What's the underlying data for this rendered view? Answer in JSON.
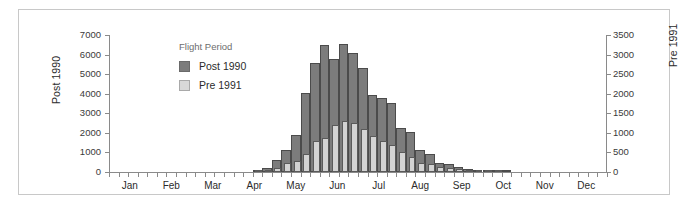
{
  "frame": {
    "border_color": "#c8c8c8"
  },
  "legend": {
    "title": "Flight Period",
    "entries": [
      {
        "label": "Post 1990",
        "color": "#7c7c7c",
        "icon": "legend-swatch-icon"
      },
      {
        "label": "Pre 1991",
        "color": "#d8d8d8",
        "icon": "legend-swatch-icon"
      }
    ]
  },
  "chart_data": {
    "type": "bar",
    "title": "",
    "subtitle": "",
    "xlabel": "",
    "legend_title": "Flight Period",
    "legend_position": "inside-upper-left",
    "grid": false,
    "bar_mode": "overlap",
    "xaxis": {
      "tick_labels": [
        "Jan",
        "Feb",
        "Mar",
        "Apr",
        "May",
        "Jun",
        "Jul",
        "Aug",
        "Sep",
        "Oct",
        "Nov",
        "Dec"
      ],
      "minor_ticks_per_label": 4,
      "bins": "weekly",
      "n_bins": 52
    },
    "yaxis_left": {
      "label": "Post 1990",
      "ylim": [
        0,
        7000
      ],
      "ticks": [
        0,
        1000,
        2000,
        3000,
        4000,
        5000,
        6000,
        7000
      ],
      "tick_labels": [
        "0",
        "1000",
        "2000",
        "3000",
        "4000",
        "5000",
        "6000",
        "7000"
      ]
    },
    "yaxis_right": {
      "label": "Pre 1991",
      "ylim": [
        0,
        3500
      ],
      "ticks": [
        0,
        500,
        1000,
        1500,
        2000,
        2500,
        3000,
        3500
      ],
      "tick_labels": [
        "0",
        "500",
        "1000",
        "1500",
        "2000",
        "2500",
        "3000",
        "3500"
      ]
    },
    "series": [
      {
        "name": "Post 1990",
        "axis": "left",
        "color": "#7c7c7c",
        "values": [
          0,
          0,
          0,
          0,
          0,
          0,
          0,
          0,
          0,
          0,
          0,
          0,
          0,
          0,
          0,
          50,
          200,
          620,
          1100,
          1900,
          4030,
          5580,
          6470,
          5800,
          6550,
          6070,
          5290,
          3950,
          3760,
          3540,
          2250,
          2020,
          1150,
          920,
          470,
          430,
          260,
          150,
          90,
          40,
          20,
          10,
          0,
          0,
          0,
          0,
          0,
          0,
          0,
          0,
          0,
          0
        ]
      },
      {
        "name": "Pre 1991",
        "axis": "right",
        "color": "#d3d3d3",
        "values": [
          0,
          0,
          0,
          0,
          0,
          0,
          0,
          0,
          0,
          0,
          0,
          0,
          0,
          0,
          0,
          10,
          40,
          115,
          230,
          275,
          450,
          780,
          870,
          1210,
          1300,
          1250,
          1110,
          920,
          790,
          700,
          500,
          390,
          220,
          200,
          130,
          110,
          70,
          35,
          20,
          10,
          5,
          0,
          0,
          0,
          0,
          0,
          0,
          0,
          0,
          0,
          0,
          0
        ]
      }
    ]
  }
}
